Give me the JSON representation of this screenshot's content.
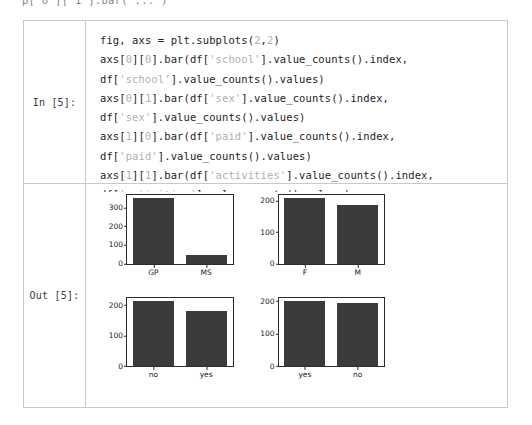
{
  "page": {
    "top_clipped_text": "p[ o ][ 1 ].bar( ... )"
  },
  "cells": {
    "input": {
      "prompt": "In [5]:",
      "code_lines": [
        [
          {
            "t": "fig, axs = plt.subplots(",
            "k": "plain"
          },
          {
            "t": "2",
            "k": "lit"
          },
          {
            "t": ",",
            "k": "plain"
          },
          {
            "t": "2",
            "k": "lit"
          },
          {
            "t": ")",
            "k": "plain"
          }
        ],
        [
          {
            "t": "axs[",
            "k": "plain"
          },
          {
            "t": "0",
            "k": "lit"
          },
          {
            "t": "][",
            "k": "plain"
          },
          {
            "t": "0",
            "k": "lit"
          },
          {
            "t": "].bar(df[",
            "k": "plain"
          },
          {
            "t": "'school'",
            "k": "lit"
          },
          {
            "t": "].value_counts().index,",
            "k": "plain"
          }
        ],
        [
          {
            "t": "df[",
            "k": "plain"
          },
          {
            "t": "'school'",
            "k": "lit"
          },
          {
            "t": "].value_counts().values)",
            "k": "plain"
          }
        ],
        [
          {
            "t": "axs[",
            "k": "plain"
          },
          {
            "t": "0",
            "k": "lit"
          },
          {
            "t": "][",
            "k": "plain"
          },
          {
            "t": "1",
            "k": "lit"
          },
          {
            "t": "].bar(df[",
            "k": "plain"
          },
          {
            "t": "'sex'",
            "k": "lit"
          },
          {
            "t": "].value_counts().index,",
            "k": "plain"
          }
        ],
        [
          {
            "t": "df[",
            "k": "plain"
          },
          {
            "t": "'sex'",
            "k": "lit"
          },
          {
            "t": "].value_counts().values)",
            "k": "plain"
          }
        ],
        [
          {
            "t": "axs[",
            "k": "plain"
          },
          {
            "t": "1",
            "k": "lit"
          },
          {
            "t": "][",
            "k": "plain"
          },
          {
            "t": "0",
            "k": "lit"
          },
          {
            "t": "].bar(df[",
            "k": "plain"
          },
          {
            "t": "'paid'",
            "k": "lit"
          },
          {
            "t": "].value_counts().index,",
            "k": "plain"
          }
        ],
        [
          {
            "t": "df[",
            "k": "plain"
          },
          {
            "t": "'paid'",
            "k": "lit"
          },
          {
            "t": "].value_counts().values)",
            "k": "plain"
          }
        ],
        [
          {
            "t": "axs[",
            "k": "plain"
          },
          {
            "t": "1",
            "k": "lit"
          },
          {
            "t": "][",
            "k": "plain"
          },
          {
            "t": "1",
            "k": "lit"
          },
          {
            "t": "].bar(df[",
            "k": "plain"
          },
          {
            "t": "'activities'",
            "k": "lit"
          },
          {
            "t": "].value_counts().index,",
            "k": "plain"
          }
        ],
        [
          {
            "t": "df[",
            "k": "plain"
          },
          {
            "t": "'activities'",
            "k": "lit"
          },
          {
            "t": "].value_counts().values)",
            "k": "plain"
          }
        ]
      ]
    },
    "output": {
      "prompt": "Out [5]:"
    }
  },
  "colors": {
    "bar": "#3b3b3b",
    "axis": "#2b2b2b",
    "table_border": "#c9c9c9",
    "code_literal": "#b0b0b0",
    "code_text": "#1c1c1c"
  },
  "chart_data": [
    {
      "type": "bar",
      "name": "school",
      "subplot": "axs[0][0]",
      "categories": [
        "GP",
        "MS"
      ],
      "values": [
        349,
        46
      ],
      "title": "",
      "xlabel": "",
      "ylabel": "",
      "ylim": [
        0,
        366
      ],
      "yticks": [
        0,
        100,
        200,
        300
      ],
      "grid": false,
      "legend": false
    },
    {
      "type": "bar",
      "name": "sex",
      "subplot": "axs[0][1]",
      "categories": [
        "F",
        "M"
      ],
      "values": [
        208,
        187
      ],
      "title": "",
      "xlabel": "",
      "ylabel": "",
      "ylim": [
        0,
        218
      ],
      "yticks": [
        0,
        100,
        200
      ],
      "grid": false,
      "legend": false
    },
    {
      "type": "bar",
      "name": "paid",
      "subplot": "axs[1][0]",
      "categories": [
        "no",
        "yes"
      ],
      "values": [
        214,
        181
      ],
      "title": "",
      "xlabel": "",
      "ylabel": "",
      "ylim": [
        0,
        225
      ],
      "yticks": [
        0,
        100,
        200
      ],
      "grid": false,
      "legend": false
    },
    {
      "type": "bar",
      "name": "activities",
      "subplot": "axs[1][1]",
      "categories": [
        "yes",
        "no"
      ],
      "values": [
        201,
        194
      ],
      "title": "",
      "xlabel": "",
      "ylabel": "",
      "ylim": [
        0,
        211
      ],
      "yticks": [
        0,
        100,
        200
      ],
      "grid": false,
      "legend": false
    }
  ]
}
